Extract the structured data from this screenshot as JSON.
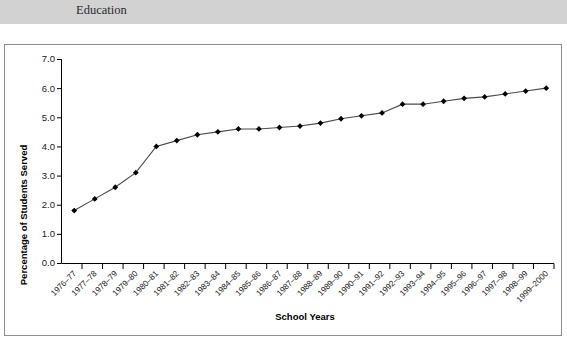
{
  "caption": {
    "line_top": "",
    "line_bottom": "Education"
  },
  "colors": {
    "band": "#d2d2d2",
    "frame_border": "#8d8d8d",
    "axis": "#000000",
    "series_line": "#4a4a4a",
    "marker": "#000000",
    "background": "#ffffff"
  },
  "chart_data": {
    "type": "line",
    "title": "",
    "xlabel": "School Years",
    "ylabel": "Percentage of Students Served",
    "ylim": [
      0.0,
      7.0
    ],
    "ytick_labels": [
      "0.0",
      "1.0",
      "2.0",
      "3.0",
      "4.0",
      "5.0",
      "6.0",
      "7.0"
    ],
    "yticks": [
      0.0,
      1.0,
      2.0,
      3.0,
      4.0,
      5.0,
      6.0,
      7.0
    ],
    "grid": false,
    "legend": "none",
    "markers": "filled-diamond",
    "categories": [
      "1976–77",
      "1977–78",
      "1978–79",
      "1979–80",
      "1980–81",
      "1981–82",
      "1982–83",
      "1983–84",
      "1984–85",
      "1985–86",
      "1986–87",
      "1987–88",
      "1988–89",
      "1989–90",
      "1990–91",
      "1991–92",
      "1992–93",
      "1993–94",
      "1994–95",
      "1995–96",
      "1996–97",
      "1997–98",
      "1998–99",
      "1999–2000"
    ],
    "values": [
      1.8,
      2.2,
      2.6,
      3.1,
      4.0,
      4.2,
      4.4,
      4.5,
      4.6,
      4.6,
      4.65,
      4.7,
      4.8,
      4.95,
      5.05,
      5.15,
      5.45,
      5.45,
      5.55,
      5.65,
      5.7,
      5.8,
      5.9,
      6.0
    ]
  }
}
